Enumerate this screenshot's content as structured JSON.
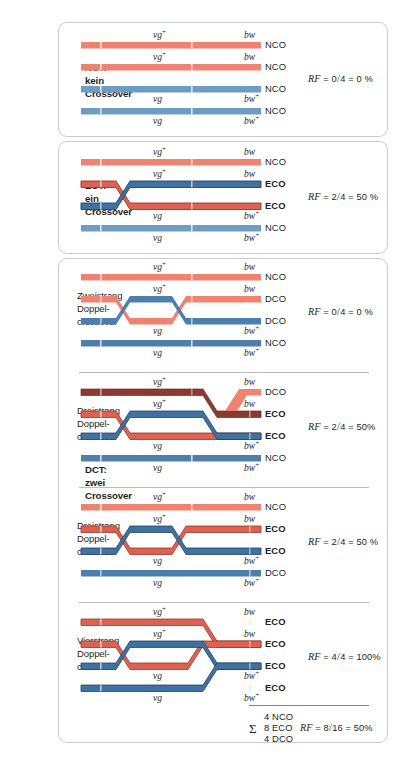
{
  "figure": {
    "colors": {
      "red_light": "#ef8372",
      "red_dark": "#e2604f",
      "red_outline": "#8c3a30",
      "blue_light": "#6e9dc4",
      "blue_dark": "#3e72a3",
      "blue_outline": "#27425e",
      "panel_border": "#c9ccce",
      "divider": "#b9bcbe",
      "text": "#231f20"
    },
    "alleles": {
      "vg_plus": "vg",
      "vg_plus_sup": "+",
      "vg": "vg",
      "bw": "bw",
      "bw_plus": "bw",
      "bw_plus_sup": "+"
    },
    "outcome_codes": {
      "nco": "NCO",
      "eco": "ECO",
      "dco": "DCO"
    }
  },
  "panels": [
    {
      "id": "nct",
      "group_label": [
        "NCT:",
        "kein",
        "Crossover"
      ],
      "group_label_bold": true,
      "rf": {
        "prefix": "RF",
        "eq": "=",
        "num": "0",
        "den": "4",
        "eq2": "=",
        "value": "0 %"
      },
      "strands": [
        {
          "color": "red_light",
          "top_gene": "vg+",
          "bottom_gene": null,
          "outcome": "NCO",
          "bold": false
        },
        {
          "color": "red_light",
          "top_gene": "vg+",
          "bottom_gene": null,
          "outcome": "NCO",
          "bold": false
        },
        {
          "color": "blue_light",
          "top_gene": null,
          "bottom_gene": "vg",
          "outcome": "NCO",
          "bold": false
        },
        {
          "color": "blue_light",
          "top_gene": null,
          "bottom_gene": "vg",
          "outcome": "NCO",
          "bold": false
        }
      ]
    },
    {
      "id": "ect",
      "group_label": [
        "ECT:",
        "ein",
        "Crossover"
      ],
      "group_label_bold": true,
      "rf": {
        "prefix": "RF",
        "eq": "=",
        "num": "2",
        "den": "4",
        "eq2": "=",
        "value": "50 %"
      },
      "strands": [
        {
          "color": "red_light",
          "outcome": "NCO",
          "bold": false
        },
        {
          "color": "red_dark",
          "outcome": "ECO",
          "bold": true
        },
        {
          "color": "blue_dark",
          "outcome": "ECO",
          "bold": true
        },
        {
          "color": "blue_light",
          "outcome": "NCO",
          "bold": false
        }
      ]
    },
    {
      "id": "zweistrang",
      "group_label": [
        "Zweistrang",
        "Doppel-",
        "crossover"
      ],
      "group_label_bold": false,
      "rf": {
        "prefix": "RF",
        "eq": "=",
        "num": "0",
        "den": "4",
        "eq2": "=",
        "value": "0 %"
      },
      "strands": [
        {
          "color": "red_light",
          "outcome": "NCO",
          "bold": false
        },
        {
          "color": "red_light",
          "outcome": "DCO",
          "bold": false
        },
        {
          "color": "blue_light",
          "outcome": "DCO",
          "bold": false
        },
        {
          "color": "blue_light",
          "outcome": "NCO",
          "bold": false
        }
      ]
    },
    {
      "id": "dreistrang-a",
      "group_label": [
        "Dreistrang",
        "Doppel-",
        "crossover"
      ],
      "group_label_bold": false,
      "rf": {
        "prefix": "RF",
        "eq": "=",
        "num": "2",
        "den": "4",
        "eq2": "=",
        "value": "50%"
      },
      "strands": [
        {
          "color": "red_dark",
          "outcome": "DCO",
          "bold": false
        },
        {
          "color": "red_dark",
          "outcome": "ECO",
          "bold": true
        },
        {
          "color": "blue_dark",
          "outcome": "ECO",
          "bold": true
        },
        {
          "color": "blue_light",
          "outcome": "NCO",
          "bold": false
        }
      ]
    },
    {
      "id": "dreistrang-b",
      "group_label": [
        "Dreistrang",
        "Doppel-",
        "crossover"
      ],
      "group_label_bold": false,
      "rf": {
        "prefix": "RF",
        "eq": "=",
        "num": "2",
        "den": "4",
        "eq2": "=",
        "value": "50 %"
      },
      "strands": [
        {
          "color": "red_light",
          "outcome": "NCO",
          "bold": false
        },
        {
          "color": "red_dark",
          "outcome": "ECO",
          "bold": true
        },
        {
          "color": "blue_dark",
          "outcome": "ECO",
          "bold": true
        },
        {
          "color": "blue_dark",
          "outcome": "DCO",
          "bold": false
        }
      ]
    },
    {
      "id": "vierstrang",
      "group_label": [
        "Vierstrang",
        "Doppel-",
        "crossover"
      ],
      "group_label_bold": false,
      "rf": {
        "prefix": "RF",
        "eq": "=",
        "num": "4",
        "den": "4",
        "eq2": "=",
        "value": "100%"
      },
      "strands": [
        {
          "color": "red_dark",
          "outcome": "ECO",
          "bold": true
        },
        {
          "color": "red_dark",
          "outcome": "ECO",
          "bold": true
        },
        {
          "color": "blue_dark",
          "outcome": "ECO",
          "bold": true
        },
        {
          "color": "blue_dark",
          "outcome": "ECO",
          "bold": true
        }
      ]
    }
  ],
  "dct_label": [
    "DCT:",
    "zwei",
    "Crossover"
  ],
  "summary": {
    "sigma": "Σ",
    "lines": [
      "4 NCO",
      "8 ECO",
      "4 DCO"
    ],
    "rf": {
      "prefix": "RF",
      "eq": "=",
      "num": "8",
      "den": "16",
      "eq2": "=",
      "value": "50%"
    }
  }
}
